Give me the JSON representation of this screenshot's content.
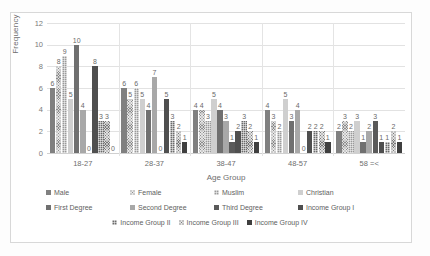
{
  "chart_data": {
    "type": "bar",
    "title": "",
    "xlabel": "Age Group",
    "ylabel": "Frequency",
    "ylim": [
      0,
      12
    ],
    "yticks": [
      0,
      2,
      4,
      6,
      8,
      10,
      12
    ],
    "grid": true,
    "legend_position": "bottom",
    "categories": [
      "18-27",
      "28-37",
      "38-47",
      "48-57",
      "58 =<"
    ],
    "series": [
      {
        "name": "Male",
        "color": "#808080",
        "pattern": "solid",
        "values": [
          6,
          6,
          4,
          4,
          2
        ]
      },
      {
        "name": "Female",
        "color": "#8d8d8d",
        "pattern": "crosshatch",
        "values": [
          8,
          5,
          4,
          3,
          3
        ]
      },
      {
        "name": "Muslim",
        "color": "#9a9a9a",
        "pattern": "checker",
        "values": [
          9,
          6,
          3,
          2,
          2
        ]
      },
      {
        "name": "Christian",
        "color": "#cfcfcf",
        "pattern": "solid",
        "values": [
          5,
          5,
          5,
          5,
          3
        ]
      },
      {
        "name": "First Degree",
        "color": "#707070",
        "pattern": "solid",
        "values": [
          10,
          4,
          4,
          3,
          1
        ]
      },
      {
        "name": "Second Degree",
        "color": "#a8a8a8",
        "pattern": "solid",
        "values": [
          4,
          7,
          3,
          4,
          2
        ]
      },
      {
        "name": "Third Degree",
        "color": "#5a5a5a",
        "pattern": "solid",
        "values": [
          0,
          0,
          1,
          0,
          3
        ]
      },
      {
        "name": "Income Group I",
        "color": "#4f4f4f",
        "pattern": "solid",
        "values": [
          8,
          5,
          2,
          2,
          1
        ]
      },
      {
        "name": "Income Group II",
        "color": "#6b6b6b",
        "pattern": "checker",
        "values": [
          3,
          3,
          3,
          2,
          1
        ]
      },
      {
        "name": "Income Group III",
        "color": "#787878",
        "pattern": "crosshatch",
        "values": [
          3,
          2,
          2,
          2,
          2
        ]
      },
      {
        "name": "Income Group IV",
        "color": "#3f3f3f",
        "pattern": "solid",
        "values": [
          0,
          1,
          1,
          1,
          1
        ]
      }
    ]
  }
}
